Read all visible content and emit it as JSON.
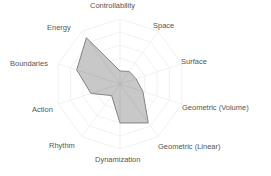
{
  "chart_data": {
    "type": "radar",
    "title": "",
    "categories": [
      "Controllability",
      "Space",
      "Surface",
      "Geometric (Volume)",
      "Geometric (Linear)",
      "Dynamization",
      "Rhythm",
      "Action",
      "Boundaries",
      "Energy"
    ],
    "series": [
      {
        "name": "profile",
        "values": [
          0.2,
          0.24,
          0.26,
          0.37,
          0.74,
          0.6,
          0.22,
          0.47,
          0.7,
          0.88
        ]
      }
    ],
    "rlim": [
      0,
      1
    ],
    "grid": true,
    "grid_rings": 5,
    "legend": "none"
  },
  "style": {
    "fill_color": "#c8c8c8",
    "stroke_color": "#777777",
    "grid_color": "#eeeeee",
    "label_color": "#555555"
  },
  "labels": {
    "controllability": "Controllability",
    "space": "Space",
    "surface": "Surface",
    "geometric_volume": "Geometric (Volume)",
    "geometric_linear": "Geometric (Linear)",
    "dynamization": "Dynamization",
    "rhythm": "Rhythm",
    "action": "Action",
    "boundaries": "Boundaries",
    "energy": "Energy"
  }
}
